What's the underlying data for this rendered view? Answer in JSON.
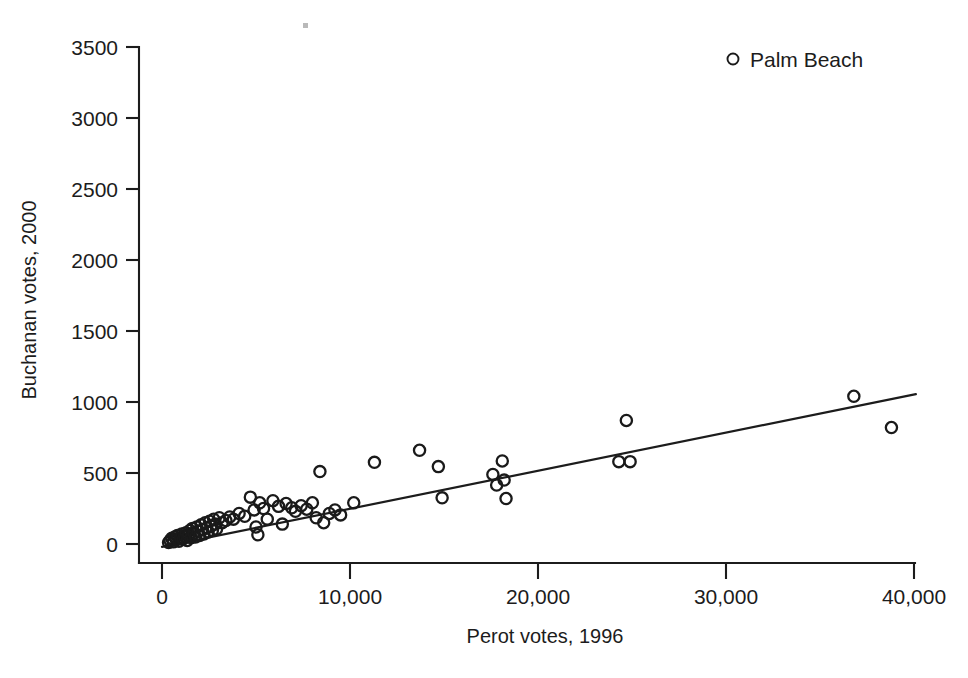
{
  "chart_data": {
    "type": "scatter",
    "title": "",
    "xlabel": "Perot votes, 1996",
    "ylabel": "Buchanan votes, 2000",
    "xlim": [
      0,
      40000
    ],
    "ylim": [
      0,
      3500
    ],
    "grid": false,
    "legend_position": "top-right",
    "legend": [
      {
        "label": "Palm Beach",
        "marker": "open-circle"
      }
    ],
    "xticks": [
      0,
      10000,
      20000,
      30000,
      40000
    ],
    "xticklabels": [
      "0",
      "10,000",
      "20,000",
      "30,000",
      "40,000"
    ],
    "yticks": [
      0,
      500,
      1000,
      1500,
      2000,
      2500,
      3000,
      3500
    ],
    "yticklabels": [
      "0",
      "500",
      "1000",
      "1500",
      "2000",
      "2500",
      "3000",
      "3500"
    ],
    "marker_style": "open-circle",
    "marker_color": "#1a1a1a",
    "fit_line": {
      "type": "linear-regression",
      "x_start": 0,
      "y_start": -20,
      "x_end": 40100,
      "y_end": 1055,
      "slope": 0.0268,
      "intercept": -20
    },
    "series": [
      {
        "name": "Florida counties",
        "points": [
          [
            350,
            10
          ],
          [
            430,
            25
          ],
          [
            520,
            40
          ],
          [
            600,
            15
          ],
          [
            680,
            50
          ],
          [
            760,
            30
          ],
          [
            820,
            60
          ],
          [
            900,
            20
          ],
          [
            980,
            45
          ],
          [
            1050,
            70
          ],
          [
            1120,
            35
          ],
          [
            1200,
            55
          ],
          [
            1280,
            80
          ],
          [
            1340,
            25
          ],
          [
            1410,
            65
          ],
          [
            1480,
            95
          ],
          [
            1550,
            45
          ],
          [
            1620,
            110
          ],
          [
            1700,
            75
          ],
          [
            1780,
            50
          ],
          [
            1850,
            120
          ],
          [
            1920,
            90
          ],
          [
            2000,
            60
          ],
          [
            2080,
            135
          ],
          [
            2150,
            100
          ],
          [
            2230,
            70
          ],
          [
            2300,
            150
          ],
          [
            2380,
            115
          ],
          [
            2450,
            85
          ],
          [
            2530,
            160
          ],
          [
            2600,
            125
          ],
          [
            2680,
            95
          ],
          [
            2750,
            175
          ],
          [
            2830,
            140
          ],
          [
            2900,
            105
          ],
          [
            3050,
            185
          ],
          [
            3200,
            150
          ],
          [
            3400,
            165
          ],
          [
            3600,
            190
          ],
          [
            3800,
            175
          ],
          [
            4100,
            215
          ],
          [
            4400,
            195
          ],
          [
            4700,
            330
          ],
          [
            4900,
            240
          ],
          [
            5000,
            120
          ],
          [
            5100,
            65
          ],
          [
            5200,
            290
          ],
          [
            5400,
            250
          ],
          [
            5600,
            175
          ],
          [
            5900,
            305
          ],
          [
            6200,
            265
          ],
          [
            6400,
            140
          ],
          [
            6600,
            285
          ],
          [
            6900,
            255
          ],
          [
            7100,
            230
          ],
          [
            7400,
            270
          ],
          [
            7700,
            245
          ],
          [
            8000,
            290
          ],
          [
            8200,
            185
          ],
          [
            8400,
            510
          ],
          [
            8600,
            150
          ],
          [
            8900,
            215
          ],
          [
            9200,
            240
          ],
          [
            9500,
            205
          ],
          [
            10200,
            290
          ],
          [
            11300,
            575
          ],
          [
            13700,
            660
          ],
          [
            14700,
            545
          ],
          [
            14900,
            325
          ],
          [
            17600,
            490
          ],
          [
            17800,
            415
          ],
          [
            18100,
            585
          ],
          [
            18200,
            450
          ],
          [
            18300,
            320
          ],
          [
            24300,
            580
          ],
          [
            24900,
            580
          ],
          [
            24700,
            870
          ],
          [
            36800,
            1040
          ],
          [
            38800,
            820
          ]
        ]
      }
    ]
  },
  "axes": {
    "y_title": "Buchanan votes, 2000",
    "x_title": "Perot votes, 1996"
  },
  "legend": {
    "palm_beach_label": "Palm Beach"
  }
}
